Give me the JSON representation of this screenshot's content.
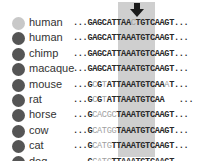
{
  "colors": {
    "highlight": "#cfcfcf",
    "dot_light": "#c8c8c8",
    "dot_dark": "#555555",
    "base_dark": "#2a2a2a",
    "base_light": "#a0a0a0"
  },
  "arrow": {
    "icon": "down-arrow-icon",
    "marks_column": "position 10 (A/C variant)"
  },
  "rows": [
    {
      "species": "human",
      "dot": "light",
      "segments": [
        {
          "t": "...GAGCATTAA",
          "s": "d"
        },
        {
          "t": "C",
          "s": "l"
        },
        {
          "t": "TGTCAAGT...",
          "s": "d"
        }
      ]
    },
    {
      "species": "human",
      "dot": "dark",
      "segments": [
        {
          "t": "...GAGCATTAAATGTCAAGT...",
          "s": "d"
        }
      ]
    },
    {
      "species": "chimp",
      "dot": "dark",
      "segments": [
        {
          "t": "...GAGCATTAAATGTCAAGT...",
          "s": "d"
        }
      ]
    },
    {
      "species": "macaque",
      "dot": "dark",
      "segments": [
        {
          "t": "...GAGCATTAAATGTCAAGT...",
          "s": "d"
        }
      ]
    },
    {
      "species": "mouse",
      "dot": "dark",
      "segments": [
        {
          "t": "...G",
          "s": "d"
        },
        {
          "t": "C",
          "s": "l"
        },
        {
          "t": "G",
          "s": "d"
        },
        {
          "t": "T",
          "s": "l"
        },
        {
          "t": "ATTAAATGTCAA",
          "s": "d"
        },
        {
          "t": "A",
          "s": "l"
        },
        {
          "t": "T...",
          "s": "d"
        }
      ]
    },
    {
      "species": "rat",
      "dot": "dark",
      "segments": [
        {
          "t": "...G",
          "s": "d"
        },
        {
          "t": "C",
          "s": "l"
        },
        {
          "t": "G",
          "s": "d"
        },
        {
          "t": "T",
          "s": "l"
        },
        {
          "t": "ATTAAATGTCAA   ...",
          "s": "d"
        }
      ]
    },
    {
      "species": "horse",
      "dot": "dark",
      "segments": [
        {
          "t": "...G",
          "s": "d"
        },
        {
          "t": "CACGC",
          "s": "l"
        },
        {
          "t": "TAAATGTCAAGT...",
          "s": "d"
        }
      ]
    },
    {
      "species": "cow",
      "dot": "dark",
      "segments": [
        {
          "t": "...G",
          "s": "d"
        },
        {
          "t": "CATGG",
          "s": "l"
        },
        {
          "t": "TAAATGTCAAGT...",
          "s": "d"
        }
      ]
    },
    {
      "species": "cat",
      "dot": "dark",
      "segments": [
        {
          "t": "...G",
          "s": "d"
        },
        {
          "t": "CATG",
          "s": "l"
        },
        {
          "t": "TTAAATGTCAAGT...",
          "s": "d"
        }
      ]
    },
    {
      "species": "dog",
      "dot": "dark",
      "segments": [
        {
          "t": "...G",
          "s": "d"
        },
        {
          "t": "CATG",
          "s": "l"
        },
        {
          "t": "TTAAATGTCAAGT...",
          "s": "d"
        }
      ]
    }
  ]
}
